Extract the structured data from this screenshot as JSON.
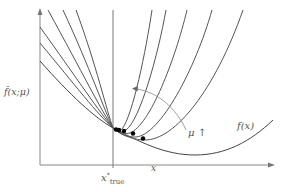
{
  "figure": {
    "y_axis_label": "f̂(x;μ)",
    "x_axis_label": "x",
    "x_true_label_main": "x",
    "x_true_label_sup": "*",
    "x_true_label_sub": "true",
    "mu_label": "μ ↑",
    "f_label": "f(x)",
    "colors": {
      "curves": "#555555",
      "axes": "#888888",
      "arrow": "#888888",
      "dots": "#000000",
      "background": "#ffffff"
    }
  }
}
